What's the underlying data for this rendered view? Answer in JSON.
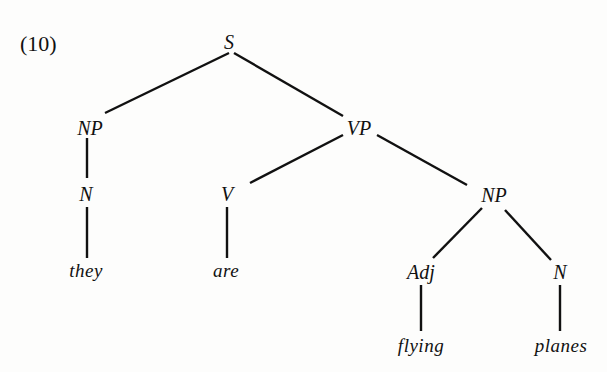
{
  "example_number": "(10)",
  "tree": {
    "nodes": {
      "s": "S",
      "np_subject": "NP",
      "vp": "VP",
      "n_subject": "N",
      "v": "V",
      "np_object": "NP",
      "adj": "Adj",
      "n_object": "N"
    },
    "words": {
      "they": "they",
      "are": "are",
      "flying": "flying",
      "planes": "planes"
    },
    "structure": "[S [NP [N they]] [VP [V are] [NP [Adj flying] [N planes]]]]"
  },
  "colors": {
    "ink": "#111111",
    "background": "#fdfdfc"
  }
}
